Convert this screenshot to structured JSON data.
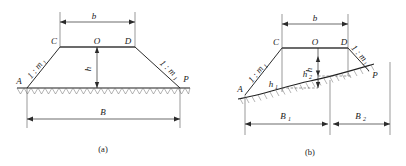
{
  "figure": {
    "background_color": "#ffffff",
    "line_color": "#2b2b2b",
    "hatch_color": "#6a6a6a"
  },
  "panels": [
    {
      "id": "a",
      "caption": "(a)",
      "description": "Symmetric embankment on level ground",
      "labels": {
        "crest_width": "b",
        "base_width": "B",
        "height": "h",
        "point_left_toe": "A",
        "point_right_toe": "P",
        "point_crest_left": "C",
        "point_crest_center": "O",
        "point_crest_right": "D",
        "slope_left": "1 : m",
        "slope_left_sub": "1",
        "slope_right": "1 : m",
        "slope_right_sub": "1"
      }
    },
    {
      "id": "b",
      "caption": "(b)",
      "description": "Embankment on sloping ground",
      "labels": {
        "crest_width": "b",
        "base_left": "B",
        "base_left_sub": "1",
        "base_right": "B",
        "base_right_sub": "2",
        "height": "h",
        "height_left": "h",
        "height_left_sub": "1",
        "height_right": "h",
        "height_right_sub": "2",
        "point_left_toe": "A",
        "point_right_toe": "P",
        "point_crest_left": "C",
        "point_crest_center": "O",
        "point_crest_right": "D",
        "slope_left": "1 : m",
        "slope_left_sub": "1",
        "slope_right": "1 : m",
        "slope_right_sub": "1"
      }
    }
  ]
}
